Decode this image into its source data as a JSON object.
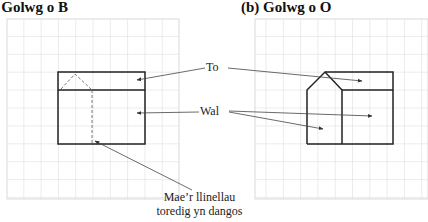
{
  "panels": [
    {
      "id": "a",
      "title": "(a)  Golwg o B"
    },
    {
      "id": "b",
      "title": "(b)  Golwg o O"
    }
  ],
  "labels": {
    "roof": "To",
    "wall": "Wal",
    "caption_line1": "Mae’r llinellau",
    "caption_line2": "toredig yn dangos"
  },
  "colors": {
    "grid": "#d9d9d9",
    "outline": "#222222",
    "arrow": "#444444"
  }
}
